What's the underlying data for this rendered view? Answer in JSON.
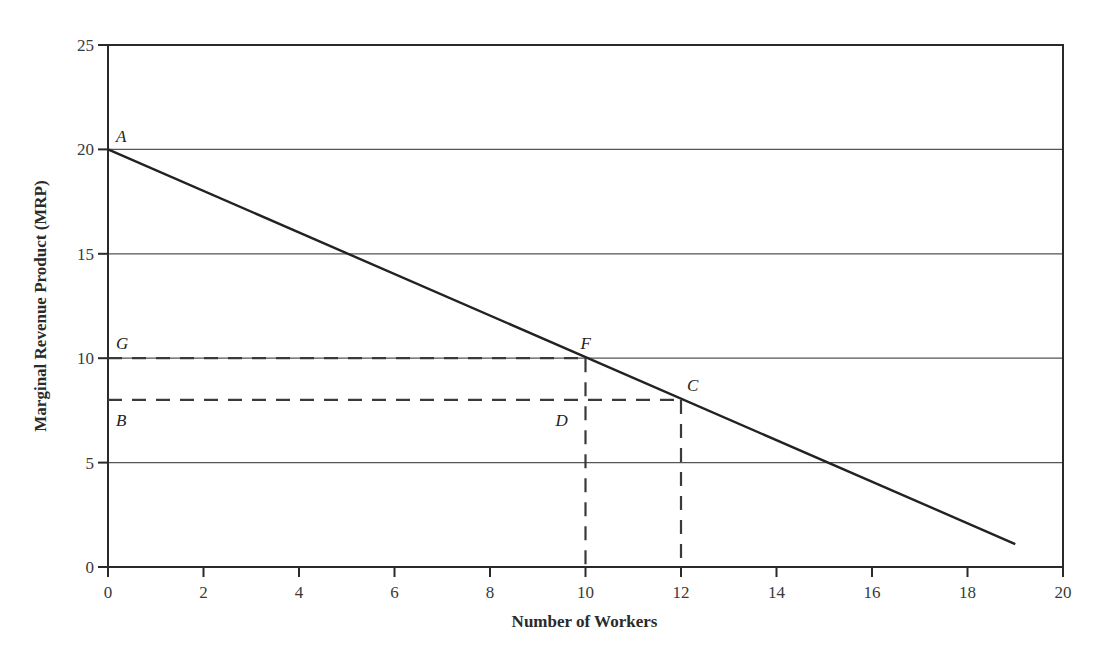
{
  "chart_data": {
    "type": "line",
    "title": "",
    "xlabel": "Number of Workers",
    "ylabel": "Marginal Revenue Product (MRP)",
    "xlim": [
      0,
      20
    ],
    "ylim": [
      0,
      25
    ],
    "x_ticks": [
      0,
      2,
      4,
      6,
      8,
      10,
      12,
      14,
      16,
      18,
      20
    ],
    "y_ticks": [
      0,
      5,
      10,
      15,
      20,
      25
    ],
    "grid": {
      "horizontal": [
        5,
        10,
        15,
        20
      ],
      "vertical": false
    },
    "series": [
      {
        "name": "MRP",
        "x": [
          0,
          19
        ],
        "y": [
          20,
          1.1
        ],
        "style": "solid"
      }
    ],
    "reference_lines": [
      {
        "name": "G-F",
        "from": [
          0,
          10
        ],
        "to": [
          10,
          10
        ],
        "style": "dashed"
      },
      {
        "name": "B-C",
        "from": [
          0,
          8
        ],
        "to": [
          12,
          8
        ],
        "style": "dashed"
      },
      {
        "name": "F-drop",
        "from": [
          10,
          10
        ],
        "to": [
          10,
          0
        ],
        "style": "dashed"
      },
      {
        "name": "C-drop",
        "from": [
          12,
          8
        ],
        "to": [
          12,
          0
        ],
        "style": "dashed"
      }
    ],
    "annotations": [
      {
        "label": "A",
        "x": 0,
        "y": 20
      },
      {
        "label": "G",
        "x": 0,
        "y": 10
      },
      {
        "label": "F",
        "x": 10,
        "y": 10
      },
      {
        "label": "B",
        "x": 0,
        "y": 8
      },
      {
        "label": "C",
        "x": 12,
        "y": 8
      },
      {
        "label": "D",
        "x": 10,
        "y": 8
      }
    ],
    "legend": null
  }
}
